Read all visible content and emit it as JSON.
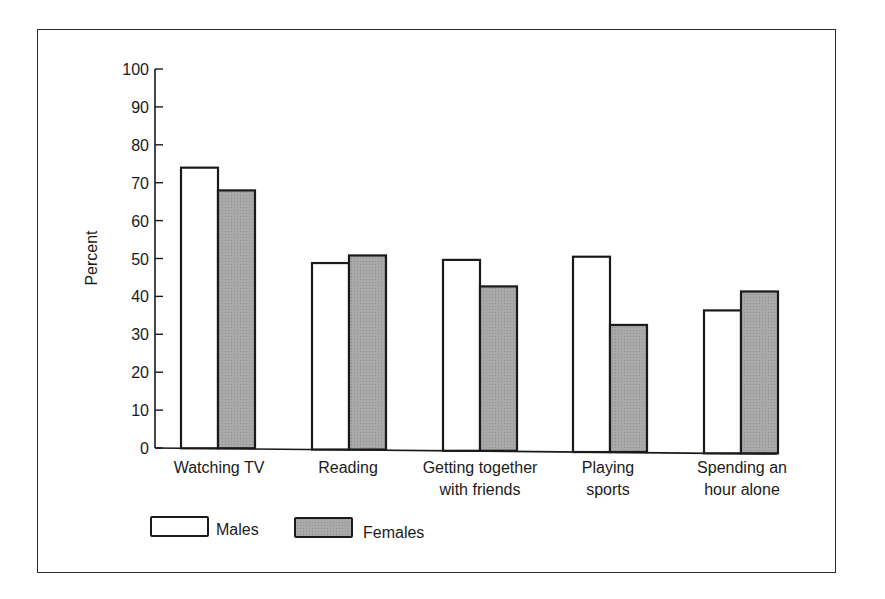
{
  "chart_data": {
    "type": "bar",
    "title": "",
    "xlabel": "",
    "ylabel": "Percent",
    "ylim": [
      0,
      100
    ],
    "yticks": [
      0,
      10,
      20,
      30,
      40,
      50,
      60,
      70,
      80,
      90,
      100
    ],
    "grid": false,
    "legend_position": "bottom-left",
    "categories": [
      [
        "Watching TV"
      ],
      [
        "Reading"
      ],
      [
        "Getting together",
        "with friends"
      ],
      [
        "Playing",
        "sports"
      ],
      [
        "Spending an",
        "hour alone"
      ]
    ],
    "category_names": [
      "Watching TV",
      "Reading",
      "Getting together with friends",
      "Playing sports",
      "Spending an hour alone"
    ],
    "series": [
      {
        "name": "Males",
        "color": "#ffffff",
        "values": [
          74,
          49,
          50,
          51,
          37
        ]
      },
      {
        "name": "Females",
        "color": "#a9a9a9",
        "values": [
          68,
          51,
          43,
          33,
          42
        ]
      }
    ]
  },
  "legend": {
    "males_label": "Males",
    "females_label": "Females"
  }
}
